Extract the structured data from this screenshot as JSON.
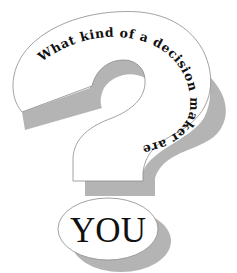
{
  "graphic": {
    "type": "question-mark-illustration",
    "arc_text": "What kind of a decision maker are",
    "dot_text": "YOU"
  },
  "colors": {
    "background": "#ffffff",
    "fill": "#ffffff",
    "outline": "#8a8a8a",
    "shadow": "#b4b4b4",
    "text": "#111111"
  }
}
